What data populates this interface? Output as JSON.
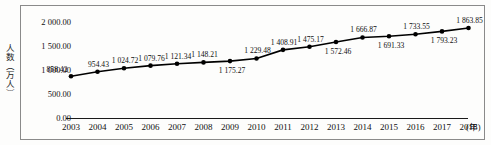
{
  "chart_data": {
    "type": "line",
    "title": "",
    "subtitle": "",
    "xlabel": "年",
    "ylabel": "人数（万人）",
    "x_unit_label": "(年)",
    "categories": [
      "2003",
      "2004",
      "2005",
      "2006",
      "2007",
      "2008",
      "2009",
      "2010",
      "2011",
      "2012",
      "2013",
      "2014",
      "2015",
      "2016",
      "2017",
      "2018"
    ],
    "values": [
      858.42,
      954.43,
      1024.72,
      1079.76,
      1121.34,
      1148.21,
      1175.27,
      1229.48,
      1408.91,
      1475.17,
      1572.46,
      1666.87,
      1691.33,
      1733.55,
      1793.23,
      1863.85
    ],
    "point_labels": [
      "858.42",
      "954.43",
      "1 024.72",
      "1 079.76",
      "1 121.34",
      "1 148.21",
      "1 175.27",
      "1 229.48",
      "1 408.91",
      "1 475.17",
      "1 572.46",
      "1 666.87",
      "1 691.33",
      "1 733.55",
      "1 793.23",
      "1 863.85"
    ],
    "point_label_positions": [
      "left",
      "above",
      "above",
      "above",
      "above",
      "above",
      "below",
      "above",
      "above",
      "above",
      "below",
      "above",
      "below",
      "above",
      "below",
      "above"
    ],
    "ylim": [
      0,
      2000
    ],
    "y_ticks": [
      0,
      500,
      1000,
      1500,
      2000
    ],
    "y_tick_labels": [
      "0.00",
      "500.00",
      "1 000.00",
      "1 500.00",
      "2 000.00"
    ],
    "grid": false,
    "legend": "none",
    "series_color": "#000000",
    "marker": "filled-circle"
  },
  "axes": {
    "y_title": "人数（万人）"
  }
}
